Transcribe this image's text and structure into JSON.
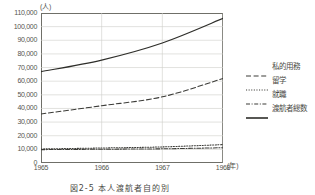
{
  "chart_data": {
    "type": "line",
    "title": "",
    "caption": "図2-5 本人渡航者自的別",
    "xlabel": "(年)",
    "ylabel": "(人)",
    "x": [
      1965,
      1966,
      1967,
      1968
    ],
    "xlim": [
      1965,
      1968
    ],
    "ylim": [
      0,
      110000
    ],
    "ytick_labels": [
      "110,000",
      "100,000",
      "90,000",
      "80,000",
      "70,000",
      "60,000",
      "50,000",
      "40,000",
      "30,000",
      "20,000",
      "10,000",
      "0"
    ],
    "ytick_values": [
      110000,
      100000,
      90000,
      80000,
      70000,
      60000,
      50000,
      40000,
      30000,
      20000,
      10000,
      0
    ],
    "xtick_labels": [
      "1965",
      "1966",
      "1967",
      "1968"
    ],
    "grid": true,
    "legend_position": "right",
    "series": [
      {
        "name": "私的用務",
        "style": "dashed",
        "color": "#3c3c38",
        "values": [
          36000,
          42000,
          48500,
          62000
        ]
      },
      {
        "name": "留学",
        "style": "dotted",
        "color": "#3c3c38",
        "values": [
          10300,
          11000,
          11800,
          13500
        ]
      },
      {
        "name": "就職",
        "style": "dashdot",
        "color": "#3c3c38",
        "values": [
          9800,
          10100,
          10400,
          11200
        ]
      },
      {
        "name": "渡航者総数",
        "style": "solid",
        "color": "#2e2e2a",
        "values": [
          67000,
          75500,
          88000,
          106000
        ]
      }
    ]
  }
}
